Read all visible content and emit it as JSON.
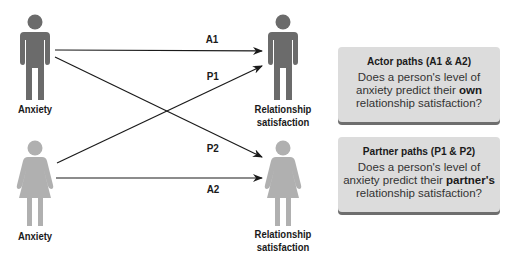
{
  "figures": {
    "left_male_label": "Anxiety",
    "left_female_label": "Anxiety",
    "right_male_label_line1": "Relationship",
    "right_male_label_line2": "satisfaction",
    "right_female_label_line1": "Relationship",
    "right_female_label_line2": "satisfaction",
    "male_color": "#6b6b6b",
    "female_color": "#b0b0b0"
  },
  "paths": {
    "a1": "A1",
    "p1": "P1",
    "p2": "P2",
    "a2": "A2"
  },
  "boxes": {
    "actor": {
      "title": "Actor paths (A1 & A2)",
      "line1": "Does a person's level of",
      "line2_pre": "anxiety predict their ",
      "line2_bold": "own",
      "line3": "relationship satisfaction?"
    },
    "partner": {
      "title": "Partner paths (P1 & P2)",
      "line1": "Does a person's level of",
      "line2_pre": "anxiety predict their ",
      "line2_bold": "partner's",
      "line3": "relationship satisfaction?"
    }
  }
}
